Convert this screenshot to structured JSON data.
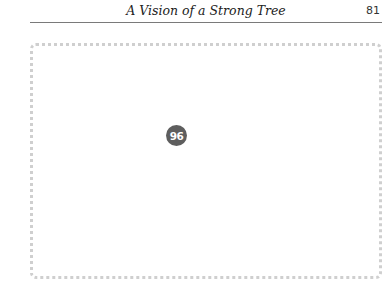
{
  "header": {
    "running_title": "A Vision of a Strong Tree",
    "page_number": "81"
  },
  "figure": {
    "badge_number": "96"
  }
}
